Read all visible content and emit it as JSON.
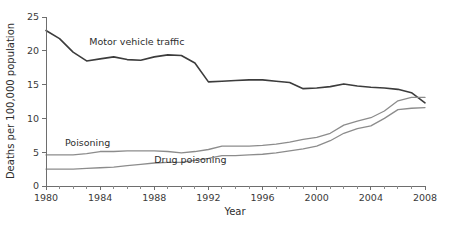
{
  "chart_data": {
    "type": "line",
    "title": "",
    "subtitle": "",
    "xlabel": "Year",
    "ylabel": "Deaths per 100,000 population",
    "xlim": [
      1980,
      2008
    ],
    "ylim": [
      0,
      25
    ],
    "grid": false,
    "legend_position": "inline-annotations",
    "x_major_ticks": [
      1980,
      1984,
      1988,
      1992,
      1996,
      2000,
      2004,
      2008
    ],
    "x_major_tick_labels": [
      "1980",
      "1984",
      "1988",
      "1992",
      "1996",
      "2000",
      "2004",
      "2008"
    ],
    "x_minor_tick_step": 1,
    "y_ticks": [
      0,
      5,
      10,
      15,
      20,
      25
    ],
    "y_tick_labels": [
      "0",
      "5",
      "10",
      "15",
      "20",
      "25"
    ],
    "x": [
      1980,
      1981,
      1982,
      1983,
      1984,
      1985,
      1986,
      1987,
      1988,
      1989,
      1990,
      1991,
      1992,
      1993,
      1994,
      1995,
      1996,
      1997,
      1998,
      1999,
      2000,
      2001,
      2002,
      2003,
      2004,
      2005,
      2006,
      2007,
      2008
    ],
    "series": [
      {
        "name": "Motor vehicle traffic",
        "color": "#3c3c3c",
        "width": 1.6,
        "label_x": 1983.2,
        "label_y": 20.8,
        "values": [
          23.0,
          21.8,
          19.8,
          18.5,
          18.8,
          19.1,
          18.7,
          18.6,
          19.1,
          19.4,
          19.3,
          18.2,
          15.4,
          15.5,
          15.6,
          15.7,
          15.7,
          15.5,
          15.3,
          14.4,
          14.5,
          14.7,
          15.1,
          14.8,
          14.6,
          14.5,
          14.3,
          13.8,
          12.3
        ]
      },
      {
        "name": "Poisoning",
        "color": "#8c8c8c",
        "width": 1.3,
        "label_x": 1981.4,
        "label_y": 5.9,
        "values": [
          4.6,
          4.6,
          4.6,
          4.8,
          5.1,
          5.1,
          5.2,
          5.2,
          5.2,
          5.1,
          4.9,
          5.1,
          5.4,
          5.9,
          5.9,
          5.9,
          6.0,
          6.2,
          6.5,
          6.9,
          7.2,
          7.8,
          9.0,
          9.6,
          10.1,
          11.1,
          12.6,
          13.1,
          13.1
        ]
      },
      {
        "name": "Drug poisoning",
        "color": "#8c8c8c",
        "width": 1.3,
        "label_x": 1988.0,
        "label_y": 3.4,
        "values": [
          2.5,
          2.5,
          2.5,
          2.6,
          2.7,
          2.8,
          3.0,
          3.2,
          3.4,
          3.5,
          3.5,
          3.8,
          4.1,
          4.5,
          4.5,
          4.6,
          4.7,
          4.9,
          5.2,
          5.5,
          5.9,
          6.7,
          7.8,
          8.5,
          8.9,
          10.0,
          11.3,
          11.5,
          11.6
        ]
      }
    ]
  },
  "footer": {
    "caption_ghost": ""
  }
}
